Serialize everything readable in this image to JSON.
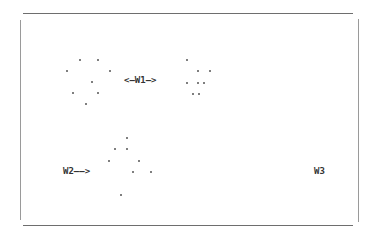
{
  "diagram": {
    "labels": {
      "w1": "<—W1—>",
      "w2": "W2——>",
      "w3": "W3"
    },
    "clusters": {
      "left": [
        [
          80,
          60
        ],
        [
          98,
          60
        ],
        [
          67,
          71
        ],
        [
          110,
          71
        ],
        [
          92,
          82
        ],
        [
          73,
          93
        ],
        [
          98,
          93
        ],
        [
          86,
          104
        ]
      ],
      "right": [
        [
          187,
          60
        ],
        [
          198,
          71
        ],
        [
          210,
          71
        ],
        [
          187,
          83
        ],
        [
          198,
          83
        ],
        [
          204,
          83
        ],
        [
          193,
          94
        ],
        [
          199,
          94
        ]
      ],
      "bottom": [
        [
          127,
          138
        ],
        [
          115,
          149
        ],
        [
          127,
          149
        ],
        [
          109,
          161
        ],
        [
          139,
          161
        ],
        [
          133,
          172
        ],
        [
          151,
          172
        ],
        [
          121,
          195
        ]
      ]
    },
    "colors": {
      "frame": "#6e6e6e",
      "dot": "#555555",
      "text": "#333333"
    }
  }
}
